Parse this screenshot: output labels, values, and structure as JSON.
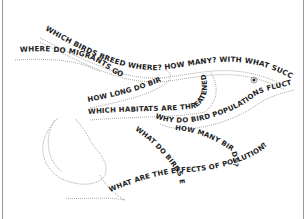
{
  "calligram": {
    "subject": "bird",
    "phrases": {
      "p1": "WHICH BIRDS BREED WHERE? HOW MANY? WITH WHAT SUCCESS?",
      "p2": "WHERE DO MIGRANTS GO?",
      "p3": "HOW LONG DO BIRDS LIVE?",
      "p4": "WHICH HABITATS ARE THREATENED?",
      "p5": "WHY DO BIRD POPULATIONS FLUCTUATE?",
      "p6": "HOW MANY BIRDS?",
      "p7": "WHAT DO BIRDS EAT?",
      "p8": "WHAT ARE THE EFFECTS OF POLLUTION?"
    },
    "colors": {
      "ink": "#222222",
      "dots": "#777777",
      "background": "#ffffff"
    }
  }
}
